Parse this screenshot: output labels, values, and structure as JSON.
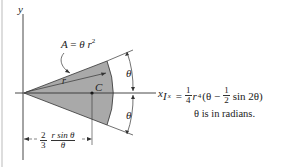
{
  "figure": {
    "axes": {
      "y_label": "y",
      "x_label": "x"
    },
    "area_label": "A = θ r²",
    "area_label_parts": {
      "lhs": "A",
      "equals": "=",
      "rhs": "θ r",
      "exp": "2"
    },
    "radius_label": "r",
    "centroid_label": "C",
    "angle_labels": [
      "θ",
      "θ"
    ],
    "centroid_distance": {
      "coef_num": "2",
      "coef_den": "3",
      "num": "r sin θ",
      "den": "θ"
    },
    "formula": {
      "lhs": "I",
      "lhs_sub": "x",
      "equals": "=",
      "coef_num": "1",
      "coef_den": "4",
      "r": "r",
      "r_exp": "4",
      "open": "(θ −",
      "half_num": "1",
      "half_den": "2",
      "tail": "sin 2θ)"
    },
    "note": "θ is in radians.",
    "colors": {
      "sector_fill": "#a9a9a9",
      "line": "#333333",
      "background": "#ffffff"
    }
  }
}
